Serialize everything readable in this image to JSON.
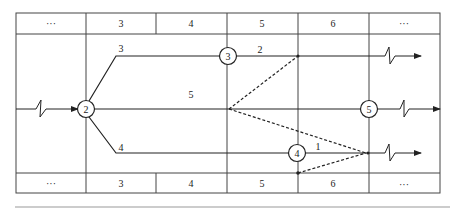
{
  "diagram": {
    "type": "time-scaled network (double-code) diagram",
    "header_row": [
      "···",
      "3",
      "4",
      "5",
      "6",
      "···"
    ],
    "footer_row": [
      "···",
      "3",
      "4",
      "5",
      "6",
      "···"
    ],
    "nodes": [
      {
        "id": "2",
        "label": "2"
      },
      {
        "id": "3",
        "label": "3"
      },
      {
        "id": "4",
        "label": "4"
      },
      {
        "id": "5",
        "label": "5"
      }
    ],
    "activities": [
      {
        "from": "2",
        "to": "3",
        "label": "3",
        "style": "solid"
      },
      {
        "from": "2",
        "to": "5",
        "label": "5",
        "style": "solid"
      },
      {
        "from": "2",
        "to": "4",
        "label": "4",
        "style": "solid"
      },
      {
        "from": "3",
        "to": "out-top",
        "label": "2",
        "style": "solid"
      },
      {
        "from": "4",
        "to": "out-bottom",
        "label": "1",
        "style": "solid"
      }
    ],
    "dummy_lines": [
      {
        "from": "mid-5",
        "to": "top-6"
      },
      {
        "from": "mid-5",
        "to": "end-bottom"
      },
      {
        "from": "node-4-bottom",
        "to": "end-bottom"
      }
    ],
    "colors": {
      "line": "#222222",
      "grid": "#444444",
      "background": "#ffffff"
    }
  }
}
